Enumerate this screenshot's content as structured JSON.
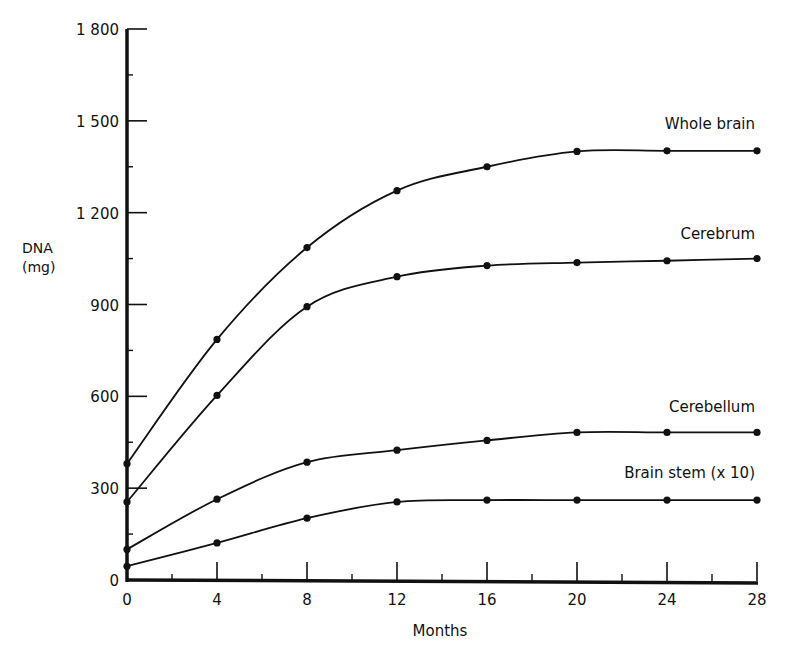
{
  "chart_data": {
    "type": "line",
    "title": "",
    "xlabel": "Months",
    "ylabel": "DNA\n(mg)",
    "ylabel_lines": [
      "DNA",
      "(mg)"
    ],
    "x": [
      0,
      4,
      8,
      12,
      16,
      20,
      24,
      28
    ],
    "xticks": [
      "0",
      "4",
      "8",
      "12",
      "16",
      "20",
      "24",
      "28"
    ],
    "yticks": [
      "0",
      "300",
      "600",
      "900",
      "1 200",
      "1 500",
      "1 800"
    ],
    "ytick_values": [
      0,
      300,
      600,
      900,
      1200,
      1500,
      1800
    ],
    "xlim": [
      0,
      28
    ],
    "ylim": [
      0,
      1800
    ],
    "grid": false,
    "legend_position": "inline labels at right end of each curve",
    "series": [
      {
        "name": "Whole brain",
        "values": [
          380,
          786,
          1086,
          1272,
          1350,
          1400,
          1402,
          1402
        ]
      },
      {
        "name": "Cerebrum",
        "values": [
          255,
          603,
          893,
          991,
          1027,
          1037,
          1043,
          1050
        ]
      },
      {
        "name": "Cerebellum",
        "values": [
          100,
          264,
          385,
          424,
          456,
          482,
          482,
          482
        ]
      },
      {
        "name": "Brain stem (x 10)",
        "values": [
          45,
          121,
          202,
          255,
          261,
          261,
          261,
          261
        ]
      }
    ]
  },
  "labels": {
    "ylabel_line1": "DNA",
    "ylabel_line2": "(mg)",
    "xlabel": "Months",
    "series_labels": [
      "Whole brain",
      "Cerebrum",
      "Cerebellum",
      "Brain stem (x 10)"
    ]
  }
}
